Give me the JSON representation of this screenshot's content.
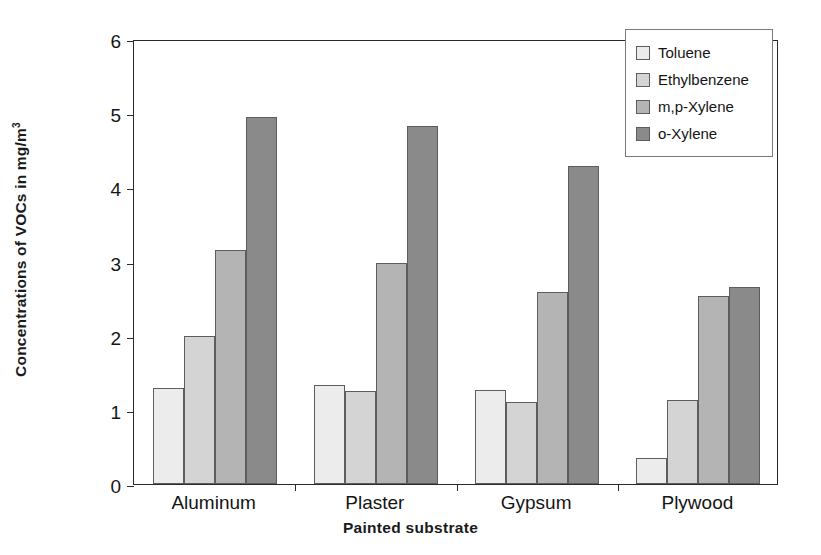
{
  "chart_data": {
    "type": "bar",
    "title": "",
    "xlabel": "Painted substrate",
    "ylabel": "Concentrations of VOCs in mg/m3",
    "ylabel_prefix": "Concentrations of VOCs in mg/m",
    "ylabel_sup": "3",
    "categories": [
      "Aluminum",
      "Plaster",
      "Gypsum",
      "Plywood"
    ],
    "series": [
      {
        "name": "Toluene",
        "color": "#ececec",
        "values": [
          1.3,
          1.34,
          1.27,
          0.35
        ]
      },
      {
        "name": "Ethylbenzene",
        "color": "#d4d4d4",
        "values": [
          2.0,
          1.25,
          1.1,
          1.13
        ]
      },
      {
        "name": "m,p-Xylene",
        "color": "#b4b4b4",
        "values": [
          3.15,
          2.98,
          2.59,
          2.53
        ]
      },
      {
        "name": "o-Xylene",
        "color": "#8a8a8a",
        "values": [
          4.95,
          4.83,
          4.29,
          2.65
        ]
      }
    ],
    "ylim": [
      0,
      6
    ],
    "yticks": [
      0,
      1,
      2,
      3,
      4,
      5,
      6
    ],
    "ytick_labels": [
      "0",
      "1",
      "2",
      "3",
      "4",
      "5",
      "6"
    ],
    "grid": false,
    "legend_position": "top-right"
  }
}
